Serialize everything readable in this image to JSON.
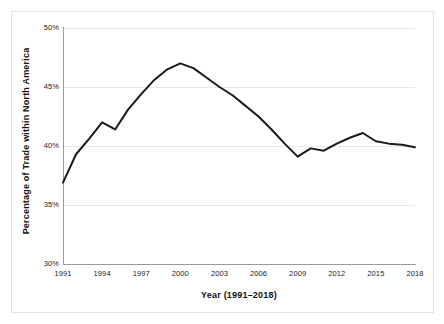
{
  "chart_data": {
    "type": "line",
    "title": "",
    "xlabel": "Year (1991–2018)",
    "ylabel": "Percentage of Trade within North America",
    "xlim": [
      1991,
      2018
    ],
    "ylim": [
      30,
      50
    ],
    "grid": true,
    "legend": false,
    "line_color": "#1a1a1a",
    "grid_color": "#e8e8e8",
    "axis_color": "#9a9a9a",
    "background_color": "#ffffff",
    "x_tick_labels": [
      "1991",
      "1994",
      "1997",
      "2000",
      "2003",
      "2006",
      "2009",
      "2012",
      "2015",
      "2018"
    ],
    "x_tick_values": [
      1991,
      1994,
      1997,
      2000,
      2003,
      2006,
      2009,
      2012,
      2015,
      2018
    ],
    "y_tick_labels": [
      "30%",
      "35%",
      "40%",
      "45%",
      "50%"
    ],
    "y_tick_values": [
      30,
      35,
      40,
      45,
      50
    ],
    "x": [
      1991,
      1992,
      1993,
      1994,
      1995,
      1996,
      1997,
      1998,
      1999,
      2000,
      2001,
      2002,
      2003,
      2004,
      2005,
      2006,
      2007,
      2008,
      2009,
      2010,
      2011,
      2012,
      2013,
      2014,
      2015,
      2016,
      2017,
      2018
    ],
    "series": [
      {
        "name": "Percentage of Trade within North America",
        "values": [
          36.9,
          39.3,
          40.6,
          42.0,
          41.4,
          43.1,
          44.4,
          45.6,
          46.5,
          47.0,
          46.6,
          45.8,
          45.0,
          44.3,
          43.4,
          42.5,
          41.4,
          40.2,
          39.1,
          39.8,
          39.6,
          40.2,
          40.7,
          41.1,
          40.4,
          40.2,
          40.1,
          39.9
        ]
      }
    ]
  }
}
